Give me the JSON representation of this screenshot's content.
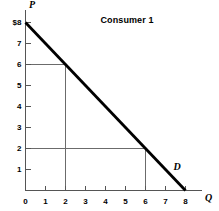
{
  "chart_data": {
    "type": "line",
    "title": "Consumer 1",
    "xlabel": "Q",
    "ylabel": "P",
    "xlim": [
      0,
      8.8
    ],
    "ylim": [
      0,
      8.6
    ],
    "grid": false,
    "legend": "none",
    "series": [
      {
        "name": "D",
        "label": "D",
        "color": "#000000",
        "points": [
          {
            "x": 0,
            "y": 8
          },
          {
            "x": 8,
            "y": 0
          }
        ]
      }
    ],
    "annotations": [
      {
        "name": "demand-curve-label",
        "text": "D",
        "x": 7.55,
        "y": 0.85
      }
    ],
    "guide_lines": [
      {
        "name": "price-6-guide",
        "type": "horizontal",
        "y": 6,
        "from_x": 0,
        "to_x": 2
      },
      {
        "name": "quantity-2-guide",
        "type": "vertical",
        "x": 2,
        "from_y": 0,
        "to_y": 6
      },
      {
        "name": "price-2-guide",
        "type": "horizontal",
        "y": 2,
        "from_x": 0,
        "to_x": 6
      },
      {
        "name": "quantity-6-guide",
        "type": "vertical",
        "x": 6,
        "from_y": 0,
        "to_y": 2
      }
    ],
    "y_ticks": [
      {
        "value": 8,
        "label": "$8"
      },
      {
        "value": 7,
        "label": "7"
      },
      {
        "value": 6,
        "label": "6"
      },
      {
        "value": 5,
        "label": "5"
      },
      {
        "value": 4,
        "label": "4"
      },
      {
        "value": 3,
        "label": "3"
      },
      {
        "value": 2,
        "label": "2"
      },
      {
        "value": 1,
        "label": "1"
      }
    ],
    "x_ticks": [
      {
        "value": 0,
        "label": "0"
      },
      {
        "value": 1,
        "label": "1"
      },
      {
        "value": 2,
        "label": "2"
      },
      {
        "value": 3,
        "label": "3"
      },
      {
        "value": 4,
        "label": "4"
      },
      {
        "value": 5,
        "label": "5"
      },
      {
        "value": 6,
        "label": "6"
      },
      {
        "value": 7,
        "label": "7"
      },
      {
        "value": 8,
        "label": "8"
      }
    ],
    "colors": {
      "axis": "#555555",
      "curve": "#000000",
      "guide": "#6b6b6b",
      "text": "#000000",
      "background": "#ffffff"
    }
  }
}
